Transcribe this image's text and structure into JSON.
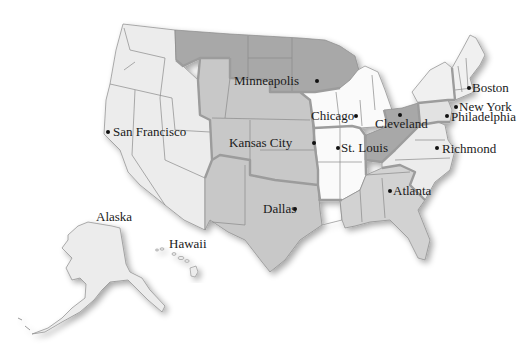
{
  "map": {
    "title": "Federal Reserve Districts",
    "colors": {
      "light": "#ececec",
      "white": "#fafafa",
      "medium": "#c8c8c8",
      "dark": "#a8a8a8",
      "border": "#9c9c9c",
      "text": "#1a1a1a"
    },
    "cities": [
      {
        "name": "San Francisco",
        "dot": [
          108,
          132
        ],
        "label": [
          113,
          125
        ]
      },
      {
        "name": "Minneapolis",
        "dot": [
          317,
          81
        ],
        "label": [
          234,
          74
        ]
      },
      {
        "name": "Chicago",
        "dot": [
          356,
          116
        ],
        "label": [
          311,
          109
        ]
      },
      {
        "name": "Kansas City",
        "dot": [
          314,
          143
        ],
        "label": [
          229,
          136
        ]
      },
      {
        "name": "St. Louis",
        "dot": [
          338,
          148
        ],
        "label": [
          341,
          141
        ]
      },
      {
        "name": "Cleveland",
        "dot": [
          400,
          115
        ],
        "label": [
          375,
          117
        ]
      },
      {
        "name": "Boston",
        "dot": [
          469,
          88
        ],
        "label": [
          472,
          81
        ]
      },
      {
        "name": "New York",
        "dot": [
          456,
          107
        ],
        "label": [
          459,
          100
        ]
      },
      {
        "name": "Philadelphia",
        "dot": [
          447,
          116
        ],
        "label": [
          451,
          110
        ]
      },
      {
        "name": "Richmond",
        "dot": [
          437,
          148
        ],
        "label": [
          442,
          142
        ]
      },
      {
        "name": "Atlanta",
        "dot": [
          390,
          191
        ],
        "label": [
          393,
          184
        ]
      },
      {
        "name": "Dallas",
        "dot": [
          295,
          209
        ],
        "label": [
          263,
          202
        ]
      }
    ],
    "regions": [
      {
        "name": "Alaska",
        "label": [
          96,
          210
        ]
      },
      {
        "name": "Hawaii",
        "label": [
          169,
          237
        ]
      }
    ]
  }
}
